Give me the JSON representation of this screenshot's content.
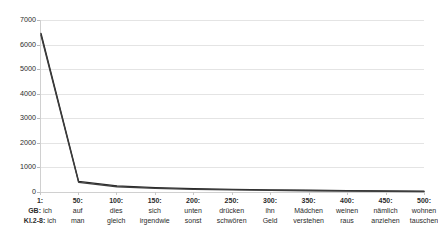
{
  "chart_data": {
    "type": "line",
    "title": "",
    "subtitle": "",
    "xlabel": "",
    "ylabel": "",
    "ylim": [
      0,
      7000
    ],
    "ytick_step": 1000,
    "yticks": [
      7000,
      6000,
      5000,
      4000,
      3000,
      2000,
      1000,
      0
    ],
    "xlim": [
      1,
      500
    ],
    "grid": true,
    "grid_axis": "y",
    "legend": false,
    "legend_position": "none",
    "x": [
      1,
      50,
      100,
      150,
      200,
      250,
      300,
      350,
      400,
      450,
      500
    ],
    "categories": [
      "1",
      "50",
      "100",
      "150",
      "200",
      "250",
      "300",
      "350",
      "400",
      "450",
      "500"
    ],
    "series": [
      {
        "name": "GB",
        "color": "#262626",
        "values": [
          6450,
          430,
          250,
          180,
          135,
          105,
          85,
          70,
          55,
          42,
          30
        ]
      },
      {
        "name": "Kl.2-8",
        "color": "#3d3d3d",
        "values": [
          6380,
          390,
          215,
          150,
          110,
          85,
          68,
          52,
          40,
          28,
          18
        ]
      }
    ],
    "x_axis_labels": [
      {
        "rank": "1:",
        "gb": "ich",
        "kl": "ich"
      },
      {
        "rank": "50:",
        "gb": "auf",
        "kl": "man"
      },
      {
        "rank": "100:",
        "gb": "dies",
        "kl": "gleich"
      },
      {
        "rank": "150:",
        "gb": "sich",
        "kl": "irgendwie"
      },
      {
        "rank": "200:",
        "gb": "unten",
        "kl": "sonst"
      },
      {
        "rank": "250:",
        "gb": "drücken",
        "kl": "schwören"
      },
      {
        "rank": "300:",
        "gb": "ihn",
        "kl": "Geld"
      },
      {
        "rank": "350:",
        "gb": "Mädchen",
        "kl": "verstehen"
      },
      {
        "rank": "400:",
        "gb": "weinen",
        "kl": "raus"
      },
      {
        "rank": "450:",
        "gb": "nämlich",
        "kl": "anziehen"
      },
      {
        "rank": "500:",
        "gb": "wohnen",
        "kl": "tauschen"
      }
    ],
    "row_keys": {
      "gb": "GB:",
      "kl": "Kl.2-8:"
    },
    "colors": {
      "gridline": "#e4e4e4",
      "axis": "#d0d0d0",
      "text": "#2b2b2b",
      "background": "#ffffff"
    }
  }
}
